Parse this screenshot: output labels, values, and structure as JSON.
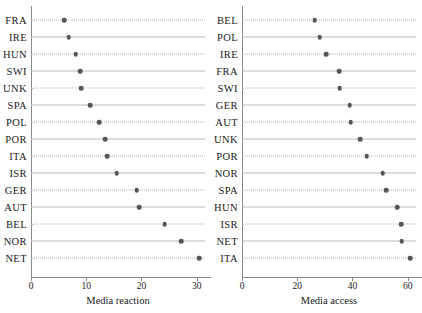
{
  "figure": {
    "width": 420,
    "height": 313,
    "background": "#ffffff",
    "dot_color": "#555555",
    "gridline_color": "#b9b9b9",
    "axis_color": "#8a8a8a"
  },
  "chart_data": [
    {
      "type": "scatter",
      "panel": "left",
      "title": "",
      "xlabel": "Media reaction",
      "ylabel": "",
      "xlim": [
        0,
        31.5
      ],
      "xticks": [
        0,
        10,
        20,
        30
      ],
      "xtick_labels": [
        "0",
        "10",
        "20",
        "30"
      ],
      "grid": true,
      "orientation": "horizontal-dot-plot",
      "categories": [
        "FRA",
        "IRE",
        "HUN",
        "SWI",
        "UNK",
        "SPA",
        "POL",
        "POR",
        "ITA",
        "ISR",
        "GER",
        "AUT",
        "BEL",
        "NOR",
        "NET"
      ],
      "values": [
        6.0,
        6.8,
        8.1,
        8.9,
        9.1,
        10.7,
        12.3,
        13.4,
        13.8,
        15.5,
        19.1,
        19.6,
        24.2,
        27.2,
        30.4
      ]
    },
    {
      "type": "scatter",
      "panel": "right",
      "title": "",
      "xlabel": "Media access",
      "ylabel": "",
      "xlim": [
        0,
        63
      ],
      "xticks": [
        0,
        20,
        40,
        60
      ],
      "xtick_labels": [
        "0",
        "20",
        "40",
        "60"
      ],
      "grid": true,
      "orientation": "horizontal-dot-plot",
      "categories": [
        "BEL",
        "POL",
        "IRE",
        "FRA",
        "SWI",
        "GER",
        "AUT",
        "UNK",
        "POR",
        "NOR",
        "SPA",
        "HUN",
        "ISR",
        "NET",
        "ITA"
      ],
      "values": [
        26.3,
        28.1,
        30.4,
        35.2,
        35.4,
        39.0,
        39.3,
        42.7,
        45.2,
        51.0,
        52.2,
        56.2,
        57.6,
        57.8,
        61.0
      ]
    }
  ]
}
